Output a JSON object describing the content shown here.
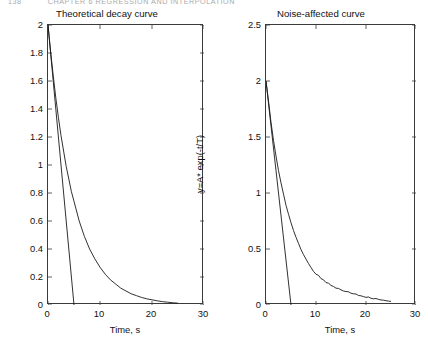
{
  "page": {
    "header_number": "138",
    "header_title": "CHAPTER 6   REGRESSION AND INTERPOLATION",
    "background_color": "#ffffff",
    "ink_color": "#1a1a1a"
  },
  "chart_data": [
    {
      "id": "theoretical-decay",
      "type": "line",
      "title": "Theoretical decay curve",
      "xlabel": "Time, s",
      "ylabel": "y=A* exp(-t/T)",
      "xlim": [
        0,
        30
      ],
      "ylim": [
        0,
        2
      ],
      "xticks": [
        0,
        10,
        20,
        30
      ],
      "xtick_labels": [
        "0",
        "10",
        "20",
        "30"
      ],
      "yticks": [
        0,
        0.2,
        0.4,
        0.6,
        0.8,
        1,
        1.2,
        1.4,
        1.6,
        1.8,
        2
      ],
      "ytick_labels": [
        "0",
        "0.2",
        "0.4",
        "0.6",
        "0.8",
        "1",
        "1.2",
        "1.4",
        "1.6",
        "1.8",
        "2"
      ],
      "grid": false,
      "legend": "none",
      "line_color": "#1a1a1a",
      "series": [
        {
          "name": "exponential decay y = 2*exp(-t/5)",
          "style": "solid",
          "x": [
            0,
            0.5,
            1,
            1.5,
            2,
            2.5,
            3,
            3.5,
            4,
            4.5,
            5,
            6,
            7,
            8,
            9,
            10,
            11,
            12,
            13,
            14,
            15,
            16,
            17,
            18,
            19,
            20,
            21,
            22,
            23,
            24,
            25
          ],
          "y": [
            2,
            1.81,
            1.64,
            1.48,
            1.34,
            1.21,
            1.1,
            0.99,
            0.9,
            0.81,
            0.74,
            0.6,
            0.49,
            0.4,
            0.33,
            0.27,
            0.22,
            0.18,
            0.15,
            0.12,
            0.1,
            0.08,
            0.067,
            0.054,
            0.044,
            0.037,
            0.03,
            0.024,
            0.02,
            0.016,
            0.013
          ]
        },
        {
          "name": "initial tangent line y = 2 - 0.4*t",
          "style": "solid",
          "x": [
            0,
            5
          ],
          "y": [
            2,
            0
          ]
        }
      ]
    },
    {
      "id": "noise-affected",
      "type": "line",
      "title": "Noise-affected curve",
      "xlabel": "Time, s",
      "ylabel": "y=A* exp(-t/T)",
      "xlim": [
        0,
        30
      ],
      "ylim": [
        0,
        2.5
      ],
      "xticks": [
        0,
        10,
        20,
        30
      ],
      "xtick_labels": [
        "0",
        "10",
        "20",
        "30"
      ],
      "yticks": [
        0,
        0.5,
        1,
        1.5,
        2,
        2.5
      ],
      "ytick_labels": [
        "0",
        "0.5",
        "1",
        "1.5",
        "2",
        "2.5"
      ],
      "grid": false,
      "legend": "none",
      "line_color": "#1a1a1a",
      "series": [
        {
          "name": "noisy exponential decay",
          "style": "solid",
          "x": [
            0,
            0.5,
            1,
            1.5,
            2,
            2.5,
            3,
            3.5,
            4,
            4.5,
            5,
            5.5,
            6,
            6.5,
            7,
            7.5,
            8,
            8.5,
            9,
            9.5,
            10,
            10.5,
            11,
            11.5,
            12,
            12.5,
            13,
            13.5,
            14,
            14.5,
            15,
            15.5,
            16,
            16.5,
            17,
            17.5,
            18,
            18.5,
            19,
            19.5,
            20,
            20.5,
            21,
            21.5,
            22,
            22.5,
            23,
            23.5,
            24,
            24.5,
            25
          ],
          "y": [
            2.0,
            1.82,
            1.63,
            1.47,
            1.33,
            1.2,
            1.09,
            0.99,
            0.89,
            0.81,
            0.735,
            0.665,
            0.605,
            0.55,
            0.495,
            0.45,
            0.41,
            0.37,
            0.335,
            0.3,
            0.275,
            0.265,
            0.235,
            0.225,
            0.2,
            0.195,
            0.175,
            0.165,
            0.15,
            0.148,
            0.135,
            0.125,
            0.12,
            0.118,
            0.105,
            0.1,
            0.098,
            0.085,
            0.082,
            0.075,
            0.068,
            0.072,
            0.06,
            0.055,
            0.058,
            0.05,
            0.045,
            0.043,
            0.038,
            0.035,
            0.032
          ]
        },
        {
          "name": "initial tangent line y = 2 - 0.4*t",
          "style": "solid",
          "x": [
            0,
            5
          ],
          "y": [
            2,
            0
          ]
        }
      ]
    }
  ]
}
